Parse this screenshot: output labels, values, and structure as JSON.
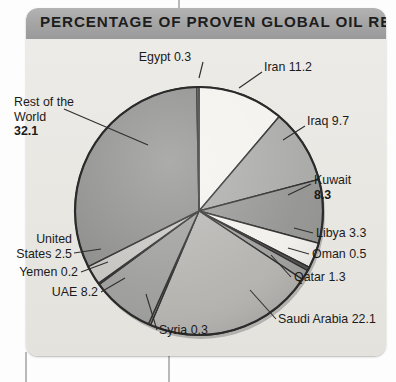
{
  "panel": {
    "title": "PERCENTAGE OF PROVEN GLOBAL OIL RESERVES"
  },
  "colors": {
    "header_bar": "#a5a5a5",
    "panel_background": "#e9e7e2",
    "slice_outline": "#2b2b2b"
  },
  "chart_data": {
    "type": "pie",
    "title": "PERCENTAGE OF PROVEN GLOBAL OIL RESERVES",
    "unit": "percent",
    "start_angle_deg": 0,
    "direction": "clockwise",
    "legend": "none",
    "labels_position": "outside-with-leader-lines",
    "categories": [
      "Iran",
      "Iraq",
      "Kuwait",
      "Libya",
      "Oman",
      "Qatar",
      "Saudi Arabia",
      "Syria",
      "UAE",
      "Yemen",
      "United States",
      "Rest of the World",
      "Egypt"
    ],
    "values": [
      11.2,
      9.7,
      8.3,
      3.3,
      0.5,
      1.3,
      22.1,
      0.3,
      8.2,
      0.2,
      2.5,
      32.1,
      0.3
    ],
    "total": 100.0,
    "slices": [
      {
        "name": "Iran",
        "value": 11.2,
        "label": "Iran 11.2",
        "color": "#f4f2ee"
      },
      {
        "name": "Iraq",
        "value": 9.7,
        "label": "Iraq 9.7",
        "color": "#a9a9a7"
      },
      {
        "name": "Kuwait",
        "value": 8.3,
        "label_line1": "Kuwait",
        "label_line2": "8.3",
        "color": "#949492"
      },
      {
        "name": "Libya",
        "value": 3.3,
        "label": "Libya 3.3",
        "color": "#f2f0ec"
      },
      {
        "name": "Oman",
        "value": 0.5,
        "label": "Oman 0.5",
        "color": "#4f4f4f"
      },
      {
        "name": "Qatar",
        "value": 1.3,
        "label": "Qatar 1.3",
        "color": "#9e9e9c"
      },
      {
        "name": "Saudi Arabia",
        "value": 22.1,
        "label": "Saudi Arabia 22.1",
        "color": "#b5b3b0"
      },
      {
        "name": "Syria",
        "value": 0.3,
        "label": "Syria 0.3",
        "color": "#8f8f8d"
      },
      {
        "name": "UAE",
        "value": 8.2,
        "label": "UAE 8.2",
        "color": "#9d9d9b"
      },
      {
        "name": "Yemen",
        "value": 0.2,
        "label": "Yemen 0.2",
        "color": "#787876"
      },
      {
        "name": "United States",
        "value": 2.5,
        "label_line1": "United",
        "label_line2": "States 2.5",
        "color": "#c6c4c1"
      },
      {
        "name": "Rest of the World",
        "value": 32.1,
        "label_line1": "Rest of the",
        "label_line2": "World",
        "label_line3": "32.1",
        "color": "#8c8c8a"
      },
      {
        "name": "Egypt",
        "value": 0.3,
        "label": "Egypt 0.3",
        "color": "#6a6a68"
      }
    ]
  }
}
